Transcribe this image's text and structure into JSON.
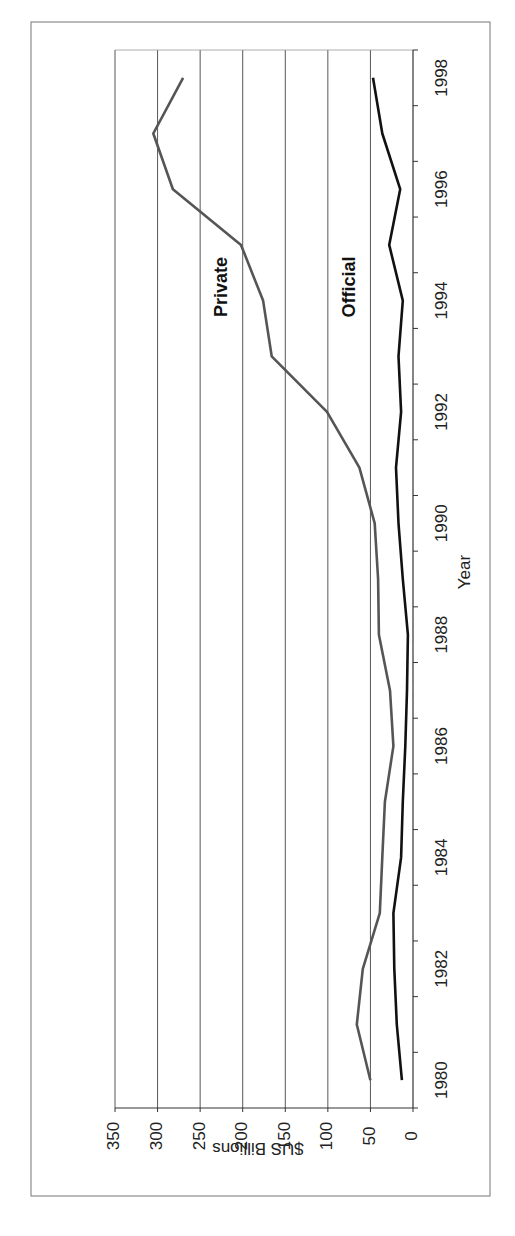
{
  "chart_data": {
    "type": "line",
    "orientation": "rotated-90-clockwise",
    "title": "",
    "xlabel": "Year",
    "ylabel": "$US Billions",
    "ylim": [
      0,
      350
    ],
    "yticks": [
      0,
      50,
      100,
      150,
      200,
      250,
      300,
      350
    ],
    "grid": true,
    "legend": "inline labels",
    "x": [
      1980,
      1981,
      1982,
      1983,
      1984,
      1985,
      1986,
      1987,
      1988,
      1989,
      1990,
      1991,
      1992,
      1993,
      1994,
      1995,
      1996,
      1997,
      1998
    ],
    "xtick_labels": [
      "1980",
      "1982",
      "1984",
      "1986",
      "1988",
      "1990",
      "1992",
      "1994",
      "1996",
      "1998"
    ],
    "series": [
      {
        "name": "Private",
        "color": "#555555",
        "values": [
          50,
          66,
          59,
          39,
          36,
          33,
          23,
          27,
          40,
          41,
          45,
          63,
          101,
          166,
          176,
          202,
          282,
          305,
          270
        ]
      },
      {
        "name": "Official",
        "color": "#111111",
        "values": [
          13,
          19,
          22,
          23,
          14,
          12,
          9,
          7,
          6,
          12,
          17,
          20,
          14,
          17,
          12,
          28,
          15,
          36,
          47
        ]
      }
    ],
    "annotations": [
      {
        "text": "Private",
        "series": "Private"
      },
      {
        "text": "Official",
        "series": "Official"
      }
    ]
  }
}
